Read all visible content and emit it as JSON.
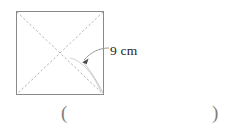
{
  "figure": {
    "shape_name": "square",
    "diagonal_label": "9 cm",
    "leader_icon": "arrow-icon",
    "colors": {
      "shape_outline": "#8a8a8a",
      "diagonal": "#b0b0b0",
      "leader": "#9a9a9a",
      "text": "#1d1d1d",
      "paren": "#7e7e7e",
      "background": "#ffffff"
    }
  },
  "answer_field": {
    "open_paren": "(",
    "close_paren": ")",
    "value": ""
  }
}
